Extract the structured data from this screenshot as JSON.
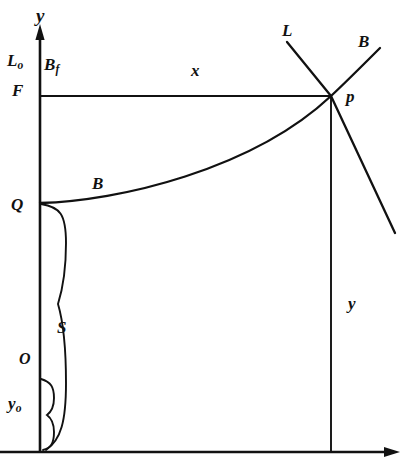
{
  "figure": {
    "background_color": "#ffffff",
    "stroke_color": "#111111",
    "width": 410,
    "height": 474
  },
  "axes": {
    "y_axis_label": "y",
    "x_axis_label": "x",
    "origin_label": "O",
    "y_axis_x": 40,
    "y_axis_top": 26,
    "y_axis_bottom": 452,
    "x_axis_y": 452,
    "x_axis_left": 0,
    "x_axis_right": 400
  },
  "labels": {
    "y_top": "y",
    "L_o": "L",
    "L_o_sub": "o",
    "F": "F",
    "B_f": "B",
    "B_f_sub": "f",
    "x_horizontal": "x",
    "L_line": "L",
    "B_curve_top": "B",
    "p_point": "p",
    "B_curve_left": "B",
    "Q_point": "Q",
    "S_brace": "S",
    "O_origin": "O",
    "y_o_brace": "y",
    "y_o_brace_sub": "o",
    "y_vertical": "y"
  },
  "geometry": {
    "p": {
      "x": 331,
      "y": 96
    },
    "Q": {
      "x": 40,
      "y": 203
    },
    "F": {
      "x": 40,
      "y": 96
    },
    "horizontal_F_line": {
      "x1": 40,
      "y1": 96,
      "x2": 331,
      "y2": 96
    },
    "vertical_drop_line": {
      "x1": 331,
      "y1": 96,
      "x2": 331,
      "y2": 452
    },
    "B_curve_path": "M40,203 C120,200 250,168 331,96",
    "B_curve_upper_path": "M331,96 C348,82 366,65 381,49",
    "L_line_path": "M286,41 L396,233",
    "S_brace_path": "M42,203 C62,206 66,216 66,245 C66,272 62,286 58,305 C62,322 66,340 66,382 C66,420 62,438 46,449",
    "yo_brace_path": "M42,378 C52,381 54,386 54,398 C54,408 51,412 48,415 C51,418 54,422 54,432 C54,442 52,447 44,450"
  },
  "label_positions": {
    "y_top": {
      "left": 36,
      "top": 8
    },
    "L_o": {
      "left": 8,
      "top": 54
    },
    "F": {
      "left": 12,
      "top": 84
    },
    "B_f": {
      "left": 45,
      "top": 58
    },
    "x_horizontal": {
      "left": 191,
      "top": 64
    },
    "L_line": {
      "left": 282,
      "top": 23
    },
    "B_curve_top": {
      "left": 358,
      "top": 34
    },
    "p_point": {
      "left": 345,
      "top": 88
    },
    "B_curve_left": {
      "left": 92,
      "top": 176
    },
    "Q_point": {
      "left": 12,
      "top": 197
    },
    "S_brace": {
      "left": 56,
      "top": 320
    },
    "O_origin": {
      "left": 18,
      "top": 352
    },
    "y_o_brace": {
      "left": 8,
      "top": 396
    },
    "y_vertical": {
      "left": 348,
      "top": 296
    }
  }
}
